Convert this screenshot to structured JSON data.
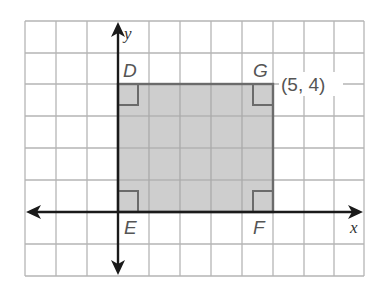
{
  "diagram": {
    "type": "coordinate-plane-rectangle",
    "grid": {
      "columns": 11,
      "rows": 8,
      "origin_col": 3,
      "origin_row_from_top": 6
    },
    "axes": {
      "x_label": "x",
      "y_label": "y"
    },
    "rectangle": {
      "fill": "#c8c8c8",
      "stroke": "#6b6b6b",
      "vertices": [
        {
          "name": "D",
          "x": 0,
          "y": 4
        },
        {
          "name": "G",
          "x": 5,
          "y": 4
        },
        {
          "name": "F",
          "x": 5,
          "y": 0
        },
        {
          "name": "E",
          "x": 0,
          "y": 0
        }
      ],
      "right_angle_marks": true
    },
    "labels": {
      "D": "D",
      "G": "G",
      "E": "E",
      "F": "F",
      "coordinate": "(5, 4)"
    }
  }
}
